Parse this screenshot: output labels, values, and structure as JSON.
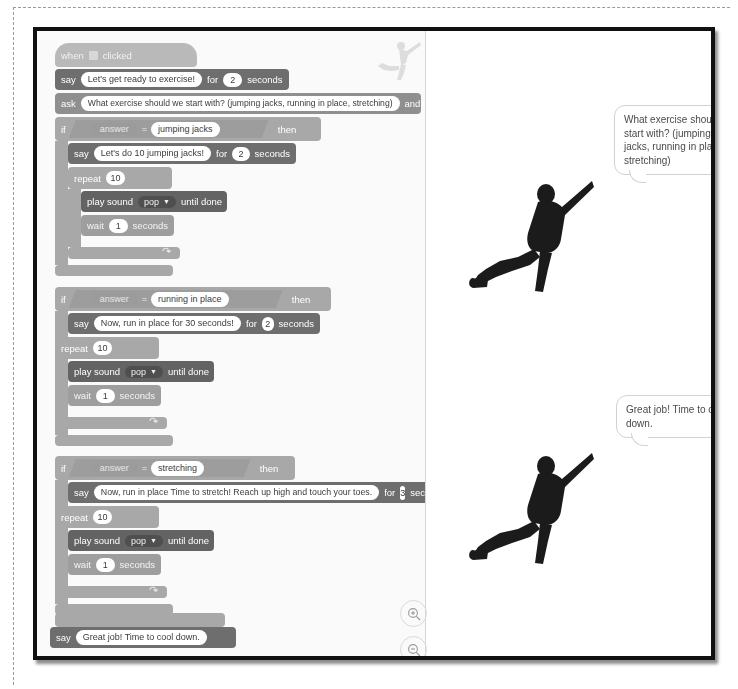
{
  "app": {
    "name": "Scratch project editor screenshot",
    "code_area_label": "code-canvas",
    "stage_area_label": "stage"
  },
  "code": {
    "hat": {
      "when": "when",
      "flag_icon": "green-flag-icon",
      "clicked": "clicked"
    },
    "blocks": [
      {
        "id": "say-1",
        "type": "say-for-seconds",
        "label": "say",
        "message": "Let's get ready to exercise!",
        "for": "for",
        "seconds_value": "2",
        "seconds": "seconds"
      },
      {
        "id": "ask-1",
        "type": "ask-and-wait",
        "label": "ask",
        "question": "What exercise should we start with? (jumping jacks, running in place, stretching)",
        "and_wait": "and wait"
      },
      {
        "id": "if-1",
        "type": "if-then",
        "label": "if",
        "operand_left": "answer",
        "operator": "=",
        "operand_right": "jumping jacks",
        "then": "then",
        "body": [
          {
            "id": "say-2",
            "type": "say-for-seconds",
            "label": "say",
            "message": "Let's do 10 jumping jacks!",
            "for": "for",
            "seconds_value": "2",
            "seconds": "seconds"
          },
          {
            "id": "repeat-1",
            "type": "repeat",
            "label": "repeat",
            "times": "10",
            "body": [
              {
                "id": "sound-1",
                "type": "play-sound-until-done",
                "label": "play sound",
                "sound": "pop",
                "until_done": "until done"
              },
              {
                "id": "wait-1",
                "type": "wait-seconds",
                "label": "wait",
                "value": "1",
                "seconds": "seconds"
              }
            ]
          }
        ]
      },
      {
        "id": "if-2",
        "type": "if-then",
        "label": "if",
        "operand_left": "answer",
        "operator": "=",
        "operand_right": "running in place",
        "then": "then",
        "body": [
          {
            "id": "say-3",
            "type": "say-for-seconds",
            "label": "say",
            "message": "Now, run in place for 30 seconds!",
            "for": "for",
            "seconds_value": "2",
            "seconds": "seconds"
          },
          {
            "id": "repeat-2",
            "type": "repeat",
            "label": "repeat",
            "times": "10",
            "body": [
              {
                "id": "sound-2",
                "type": "play-sound-until-done",
                "label": "play sound",
                "sound": "pop",
                "until_done": "until done"
              },
              {
                "id": "wait-2",
                "type": "wait-seconds",
                "label": "wait",
                "value": "1",
                "seconds": "seconds"
              }
            ]
          }
        ]
      },
      {
        "id": "if-3",
        "type": "if-then",
        "label": "if",
        "operand_left": "answer",
        "operator": "=",
        "operand_right": "stretching",
        "then": "then",
        "body": [
          {
            "id": "say-4",
            "type": "say-for-seconds",
            "label": "say",
            "message": "Now, run in place Time to stretch! Reach up high and touch your toes.",
            "for": "for",
            "seconds_value": "3",
            "seconds": "seconds"
          },
          {
            "id": "repeat-3",
            "type": "repeat",
            "label": "repeat",
            "times": "10",
            "body": [
              {
                "id": "sound-3",
                "type": "play-sound-until-done",
                "label": "play sound",
                "sound": "pop",
                "until_done": "until done"
              },
              {
                "id": "wait-3",
                "type": "wait-seconds",
                "label": "wait",
                "value": "1",
                "seconds": "seconds"
              }
            ]
          }
        ]
      },
      {
        "id": "say-5",
        "type": "say",
        "label": "say",
        "message": "Great job! Time to cool down."
      }
    ]
  },
  "stage": {
    "bubbles": [
      {
        "id": "bubble-1",
        "text": "What exercise should we start with? (jumping jacks, running in place, stretching)"
      },
      {
        "id": "bubble-2",
        "text": "Great job! Time to cool down."
      }
    ],
    "sprites": [
      {
        "id": "sprite-thumb",
        "name": "exercising-person-sprite-faint"
      },
      {
        "id": "sprite-1",
        "name": "exercising-person-sprite"
      },
      {
        "id": "sprite-2",
        "name": "exercising-person-sprite"
      }
    ],
    "zoom_controls": [
      {
        "id": "zoom-in",
        "name": "zoom-in-icon",
        "glyph": "+"
      },
      {
        "id": "zoom-out",
        "name": "zoom-out-icon",
        "glyph": "−"
      }
    ]
  },
  "colors": {
    "event_block": "#b9b9b9",
    "looks_block": "#6e6e6e",
    "sensing_block": "#8f8f8f",
    "control_block": "#a8a8a8",
    "sound_block": "#636363",
    "frame_border": "#111111"
  }
}
